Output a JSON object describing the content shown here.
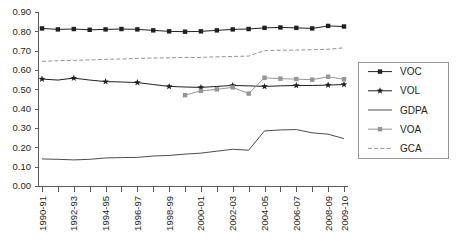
{
  "chart_data": {
    "type": "line",
    "title": "",
    "xlabel": "",
    "ylabel": "",
    "ylim": [
      0.0,
      0.9
    ],
    "ytick_labels": [
      "0.00",
      "0.10",
      "0.20",
      "0.30",
      "0.40",
      "0.50",
      "0.60",
      "0.70",
      "0.80",
      "0.90"
    ],
    "ytick_values": [
      0.0,
      0.1,
      0.2,
      0.3,
      0.4,
      0.5,
      0.6,
      0.7,
      0.8,
      0.9
    ],
    "grid": false,
    "legend_position": "right",
    "categories": [
      "1990-91",
      "1991-92",
      "1992-93",
      "1993-94",
      "1994-95",
      "1995-96",
      "1996-97",
      "1997-98",
      "1998-99",
      "1999-2000",
      "2000-01",
      "2001-02",
      "2002-03",
      "2003-04",
      "2004-05",
      "2005-06",
      "2006-07",
      "2007-08",
      "2008-09",
      "2009-10"
    ],
    "xtick_labels": [
      "1990-91",
      "",
      "1992-93",
      "",
      "1994-95",
      "",
      "1996-97",
      "",
      "1998-99",
      "",
      "2000-01",
      "",
      "2002-03",
      "",
      "2004-05",
      "",
      "2006-07",
      "",
      "2008-09",
      "2009-10"
    ],
    "series": [
      {
        "name": "VOC",
        "color": "#231f20",
        "marker": "square",
        "dash": "none",
        "values": [
          0.815,
          0.81,
          0.812,
          0.808,
          0.81,
          0.812,
          0.81,
          0.805,
          0.8,
          0.798,
          0.8,
          0.805,
          0.81,
          0.812,
          0.818,
          0.82,
          0.818,
          0.815,
          0.828,
          0.825
        ]
      },
      {
        "name": "VOL",
        "color": "#231f20",
        "marker": "star",
        "dash": "none",
        "values": [
          0.553,
          0.548,
          0.558,
          0.548,
          0.54,
          0.538,
          0.535,
          0.525,
          0.515,
          0.512,
          0.51,
          0.515,
          0.52,
          0.518,
          0.515,
          0.518,
          0.52,
          0.52,
          0.522,
          0.525
        ]
      },
      {
        "name": "GDPA",
        "color": "#4d4d4f",
        "marker": "none",
        "dash": "none",
        "values": [
          0.14,
          0.138,
          0.135,
          0.138,
          0.145,
          0.147,
          0.148,
          0.155,
          0.158,
          0.165,
          0.17,
          0.18,
          0.19,
          0.185,
          0.285,
          0.29,
          0.292,
          0.275,
          0.268,
          0.245
        ]
      },
      {
        "name": "VOA",
        "color": "#939598",
        "marker": "square",
        "dash": "none",
        "values": [
          null,
          null,
          null,
          null,
          null,
          null,
          null,
          null,
          null,
          0.47,
          0.492,
          0.5,
          0.51,
          0.478,
          0.56,
          0.555,
          0.553,
          0.55,
          0.565,
          0.552
        ]
      },
      {
        "name": "GCA",
        "color": "#939598",
        "marker": "none",
        "dash": "dashed",
        "values": [
          0.645,
          0.648,
          0.65,
          0.652,
          0.655,
          0.657,
          0.66,
          0.662,
          0.663,
          0.665,
          0.665,
          0.668,
          0.67,
          0.672,
          0.7,
          0.702,
          0.703,
          0.705,
          0.707,
          0.715
        ]
      }
    ],
    "legend_entries": [
      {
        "label": "VOC",
        "color": "#231f20",
        "marker": "square",
        "dash": "none"
      },
      {
        "label": "VOL",
        "color": "#231f20",
        "marker": "star",
        "dash": "none"
      },
      {
        "label": "GDPA",
        "color": "#4d4d4f",
        "marker": "none",
        "dash": "none"
      },
      {
        "label": "VOA",
        "color": "#939598",
        "marker": "square",
        "dash": "none"
      },
      {
        "label": "GCA",
        "color": "#939598",
        "marker": "none",
        "dash": "dashed"
      }
    ]
  },
  "layout": {
    "plot_left": 38,
    "plot_right": 348,
    "plot_top": 12,
    "plot_bottom": 186,
    "legend_x": 358,
    "legend_y": 62,
    "legend_w": 90,
    "legend_h": 96
  }
}
